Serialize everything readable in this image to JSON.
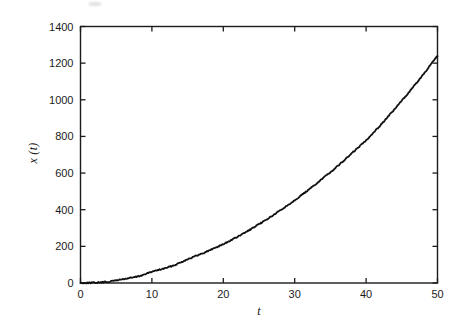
{
  "figure": {
    "background_color": "#ffffff",
    "line_color": "#111111",
    "axis_color": "#1b1b1b"
  },
  "chart_data": {
    "type": "line",
    "title": "",
    "xlabel": "t",
    "ylabel": "x (t)",
    "xlim": [
      0,
      50
    ],
    "ylim": [
      0,
      1400
    ],
    "xticks": [
      0,
      10,
      20,
      30,
      40,
      50
    ],
    "yticks": [
      0,
      200,
      400,
      600,
      800,
      1000,
      1200,
      1400
    ],
    "xtick_labels": [
      "0",
      "10",
      "20",
      "30",
      "40",
      "50"
    ],
    "ytick_labels": [
      "0",
      "200",
      "400",
      "600",
      "800",
      "1000",
      "1200",
      "1400"
    ],
    "grid": false,
    "legend": null,
    "series": [
      {
        "name": "x(t)",
        "color": "#111111",
        "style": "solid",
        "x": [
          0,
          1,
          2,
          3,
          4,
          5,
          6,
          7,
          8,
          9,
          10,
          11,
          12,
          13,
          14,
          15,
          16,
          17,
          18,
          19,
          20,
          21,
          22,
          23,
          24,
          25,
          26,
          27,
          28,
          29,
          30,
          31,
          32,
          33,
          34,
          35,
          36,
          37,
          38,
          39,
          40,
          41,
          42,
          43,
          44,
          45,
          46,
          47,
          48,
          49,
          50
        ],
        "y": [
          0,
          1,
          2,
          4,
          7,
          15,
          21,
          28,
          35,
          47,
          62,
          72,
          82,
          95,
          112,
          130,
          145,
          160,
          177,
          195,
          212,
          232,
          252,
          274,
          297,
          320,
          345,
          370,
          397,
          424,
          452,
          481,
          510,
          541,
          573,
          605,
          638,
          672,
          708,
          743,
          779,
          820,
          861,
          905,
          949,
          995,
          1041,
          1089,
          1137,
          1188,
          1240
        ]
      }
    ]
  }
}
